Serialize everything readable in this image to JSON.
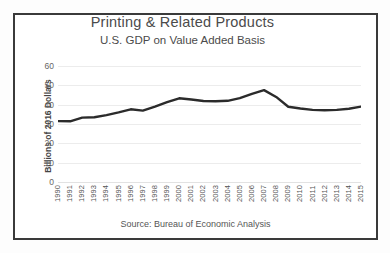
{
  "chart_data": {
    "type": "line",
    "title": "Printing & Related Products",
    "subtitle": "U.S. GDP on Value Added Basis",
    "xlabel": "",
    "ylabel": "Billions of 2016 Dollars",
    "ylim": [
      0,
      60
    ],
    "yticks": [
      60,
      50,
      40,
      30,
      20,
      10,
      0
    ],
    "grid": true,
    "legend": null,
    "source": "Source: Bureau of Economic Analysis",
    "line_color": "#2b2b2b",
    "categories": [
      "1990",
      "1991",
      "1992",
      "1993",
      "1994",
      "1995",
      "1996",
      "1997",
      "1998",
      "1999",
      "2000",
      "2001",
      "2002",
      "2003",
      "2004",
      "2005",
      "2006",
      "2007",
      "2008",
      "2009",
      "2010",
      "2011",
      "2012",
      "2013",
      "2014",
      "2015"
    ],
    "values": [
      31.5,
      31.4,
      33.3,
      33.5,
      34.6,
      36.0,
      37.6,
      36.9,
      39.0,
      41.3,
      43.3,
      42.7,
      41.9,
      41.8,
      42.0,
      43.4,
      45.6,
      47.5,
      44.0,
      38.9,
      38.0,
      37.3,
      37.1,
      37.3,
      37.9,
      39.0
    ],
    "annotations": []
  }
}
